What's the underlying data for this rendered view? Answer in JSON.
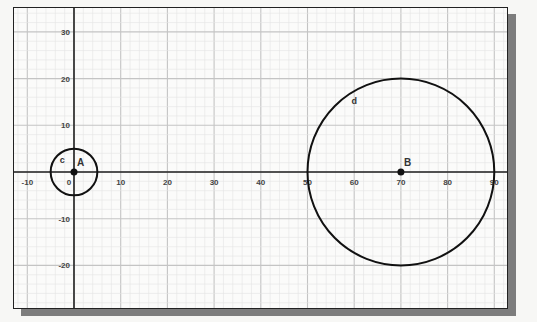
{
  "canvas": {
    "frame": {
      "x": 13,
      "y": 7,
      "width": 495,
      "height": 302
    },
    "origin_px": {
      "x": 60,
      "y": 164
    },
    "px_per_unit": 4.67,
    "colors": {
      "background": "#fbfbfa",
      "minor_grid": "#e4e4e4",
      "major_grid": "#c4c4c4",
      "axis": "#222222",
      "object": "#111111",
      "shadow": "#7d7d7d"
    }
  },
  "axes": {
    "x_ticks": [
      {
        "value": -10,
        "label": "-10"
      },
      {
        "value": 0,
        "label": "0"
      },
      {
        "value": 10,
        "label": "10"
      },
      {
        "value": 20,
        "label": "20"
      },
      {
        "value": 30,
        "label": "30"
      },
      {
        "value": 40,
        "label": "40"
      },
      {
        "value": 50,
        "label": "50"
      },
      {
        "value": 60,
        "label": "60"
      },
      {
        "value": 70,
        "label": "70"
      },
      {
        "value": 80,
        "label": "80"
      },
      {
        "value": 90,
        "label": "90"
      }
    ],
    "y_ticks": [
      {
        "value": 30,
        "label": "30"
      },
      {
        "value": 20,
        "label": "20"
      },
      {
        "value": 10,
        "label": "10"
      },
      {
        "value": -10,
        "label": "-10"
      },
      {
        "value": -20,
        "label": "-20"
      }
    ]
  },
  "objects": {
    "points": [
      {
        "name": "A",
        "label": "A",
        "x": 0,
        "y": 0
      },
      {
        "name": "B",
        "label": "B",
        "x": 70,
        "y": 0
      }
    ],
    "circles": [
      {
        "name": "c",
        "label": "c",
        "center": "A",
        "cx": 0,
        "cy": 0,
        "r": 5,
        "label_pos": {
          "x": -2.5,
          "y": 2
        }
      },
      {
        "name": "d",
        "label": "d",
        "center": "B",
        "cx": 70,
        "cy": 0,
        "r": 20,
        "label_pos": {
          "x": 60,
          "y": 14.5
        }
      }
    ]
  }
}
